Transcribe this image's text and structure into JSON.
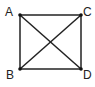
{
  "diagram": {
    "type": "square-with-diagonals",
    "vertices": [
      {
        "label": "A",
        "x": 20,
        "y": 15,
        "lx": 5,
        "ly": 16
      },
      {
        "label": "C",
        "x": 81,
        "y": 15,
        "lx": 83,
        "ly": 16
      },
      {
        "label": "B",
        "x": 20,
        "y": 69,
        "lx": 6,
        "ly": 79
      },
      {
        "label": "D",
        "x": 81,
        "y": 69,
        "lx": 83,
        "ly": 79
      }
    ],
    "edges": [
      [
        "A",
        "C"
      ],
      [
        "C",
        "D"
      ],
      [
        "D",
        "B"
      ],
      [
        "B",
        "A"
      ],
      [
        "A",
        "D"
      ],
      [
        "B",
        "C"
      ]
    ],
    "stroke_color": "#222222"
  }
}
